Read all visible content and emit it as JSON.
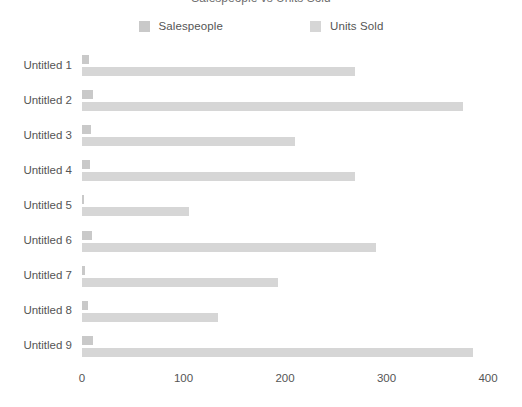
{
  "chart_data": {
    "type": "bar",
    "orientation": "horizontal",
    "title": "Salespeople vs Units Sold",
    "subtitle": "",
    "xlabel": "",
    "ylabel": "",
    "xlim": [
      0,
      400
    ],
    "xticks": [
      0,
      100,
      200,
      300,
      400
    ],
    "xtick_labels": [
      "0",
      "100",
      "200",
      "300",
      "400"
    ],
    "grid": false,
    "legend_position": "top-center",
    "categories": [
      "Untitled 1",
      "Untitled 2",
      "Untitled 3",
      "Untitled 4",
      "Untitled 5",
      "Untitled 6",
      "Untitled 7",
      "Untitled 8",
      "Untitled 9"
    ],
    "series": [
      {
        "name": "Salespeople",
        "color": "#c9c9c9",
        "values": [
          7,
          11,
          9,
          8,
          2,
          10,
          3,
          6,
          11
        ]
      },
      {
        "name": "Units Sold",
        "color": "#d6d6d6",
        "values": [
          269,
          375,
          210,
          269,
          105,
          290,
          193,
          134,
          385
        ]
      }
    ]
  },
  "colors": {
    "background": "#ffffff",
    "text": "#555555",
    "series_salespeople": "#c9c9c9",
    "series_units_sold": "#d6d6d6"
  }
}
